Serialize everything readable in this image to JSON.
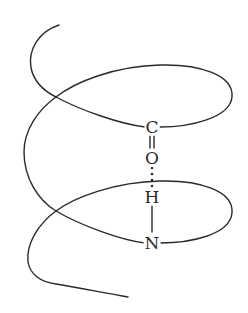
{
  "diagram": {
    "type": "alpha-helix hydrogen bond schematic",
    "stroke_color": "#2a2a2a",
    "atoms": {
      "carbon": "C",
      "oxygen": "O",
      "hydrogen": "H",
      "nitrogen": "N"
    },
    "bonds": {
      "c_o": "double",
      "o_h": "hydrogen-bond (dotted)",
      "h_n": "single"
    }
  }
}
